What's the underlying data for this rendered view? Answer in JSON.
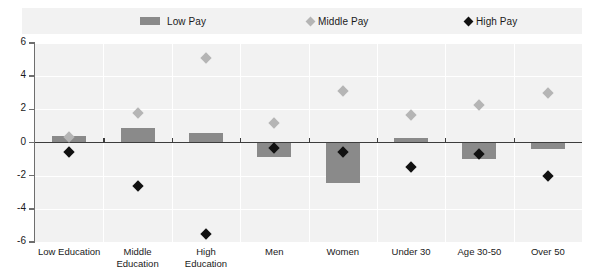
{
  "legend": {
    "items": [
      {
        "label": "Low  Pay",
        "marker": "bar-swatch",
        "color": "#8a8a8a",
        "left": 118
      },
      {
        "label": "Middle Pay",
        "marker": "diamond-marker",
        "color": "#b5b5b5",
        "left": 285
      },
      {
        "label": "High Pay",
        "marker": "diamond-marker",
        "color": "#111111",
        "left": 443
      }
    ]
  },
  "axis": {
    "y_ticks": [
      "6",
      "4",
      "2",
      "0",
      "-2",
      "-4",
      "-6"
    ],
    "y_min": -6,
    "y_max": 6
  },
  "chart_data": {
    "type": "bar",
    "title": "",
    "xlabel": "",
    "ylabel": "",
    "ylim": [
      -6,
      6
    ],
    "ytick_step": 2,
    "grid": true,
    "legend_position": "top",
    "categories": [
      "Low Education",
      "Middle\nEducation",
      "High\nEducation",
      "Men",
      "Women",
      "Under 30",
      "Age 30-50",
      "Over 50"
    ],
    "series": [
      {
        "name": "Low  Pay",
        "type": "bar",
        "color": "#8a8a8a",
        "values": [
          0.4,
          0.85,
          0.6,
          -0.85,
          -2.45,
          0.3,
          -1.0,
          -0.4
        ]
      },
      {
        "name": "Middle Pay",
        "type": "diamond",
        "color": "#b5b5b5",
        "values": [
          0.35,
          1.8,
          5.1,
          1.2,
          3.1,
          1.65,
          2.25,
          3.0
        ]
      },
      {
        "name": "High Pay",
        "type": "diamond",
        "color": "#111111",
        "values": [
          -0.6,
          -2.6,
          -5.5,
          -0.35,
          -0.6,
          -1.45,
          -0.7,
          -2.05
        ]
      }
    ]
  }
}
